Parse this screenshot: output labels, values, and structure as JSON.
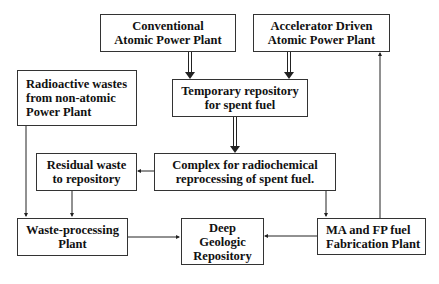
{
  "nodes": {
    "conventional": {
      "lines": [
        "Conventional",
        "Atomic Power Plant"
      ]
    },
    "accelerator": {
      "lines": [
        "Accelerator Driven",
        "Atomic Power Plant"
      ]
    },
    "temporary": {
      "lines": [
        "Temporary repository",
        "for spent fuel"
      ]
    },
    "radioactive": {
      "lines": [
        "Radioactive wastes",
        "from non-atomic",
        "Power Plant"
      ]
    },
    "residual": {
      "lines": [
        "Residual waste",
        "to repository"
      ]
    },
    "complex": {
      "lines": [
        "Complex for radiochemical",
        "reprocessing of spent fuel."
      ]
    },
    "waste_processing": {
      "lines": [
        "Waste-processing",
        "Plant"
      ]
    },
    "deep_geologic": {
      "lines": [
        "Deep",
        "Geologic",
        "Repository"
      ]
    },
    "ma_fp": {
      "lines": [
        "MA and FP fuel",
        "Fabrication Plant"
      ]
    }
  },
  "edges": [
    {
      "from": "conventional",
      "to": "temporary",
      "style": "double"
    },
    {
      "from": "accelerator",
      "to": "temporary",
      "style": "double"
    },
    {
      "from": "temporary",
      "to": "complex",
      "style": "double"
    },
    {
      "from": "complex",
      "to": "residual",
      "style": "single"
    },
    {
      "from": "complex",
      "to": "ma_fp",
      "style": "single"
    },
    {
      "from": "radioactive",
      "to": "waste_processing",
      "style": "single"
    },
    {
      "from": "residual",
      "to": "waste_processing",
      "style": "single"
    },
    {
      "from": "waste_processing",
      "to": "deep_geologic",
      "style": "single"
    },
    {
      "from": "ma_fp",
      "to": "deep_geologic",
      "style": "single"
    },
    {
      "from": "ma_fp",
      "to": "accelerator",
      "style": "single"
    }
  ]
}
